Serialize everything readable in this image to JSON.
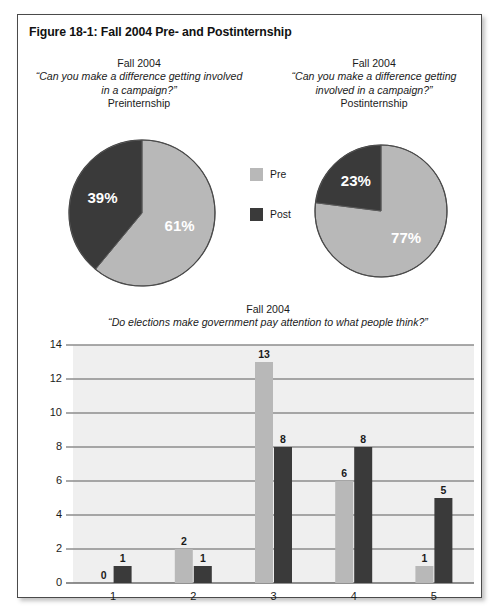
{
  "figure": {
    "title": "Figure 18-1:  Fall 2004 Pre- and Postinternship"
  },
  "colors": {
    "pre": "#b8b8b8",
    "post": "#3a3a3a",
    "plot_background": "#efefef",
    "gridline": "#8d8d8d",
    "axis": "#6b6b6b",
    "border": "#4a4a4a",
    "label_text": "#1b1b1b",
    "slice_label_text": "#ffffff"
  },
  "legend": {
    "items": [
      {
        "label": "Pre",
        "color": "#b8b8b8"
      },
      {
        "label": "Post",
        "color": "#3a3a3a"
      }
    ]
  },
  "pies": {
    "left": {
      "season": "Fall 2004",
      "question": "“Can you make a difference getting involved in a campaign?”",
      "phase": "Preinternship",
      "labels": [
        "61%",
        "39%"
      ]
    },
    "right": {
      "season": "Fall 2004",
      "question": "“Can you make a difference getting involved in a campaign?”",
      "phase": "Postinternship",
      "labels": [
        "77%",
        "23%"
      ]
    }
  },
  "bar_header": {
    "season": "Fall 2004",
    "question": "“Do elections make government pay attention to what people think?”"
  },
  "chart_data": [
    {
      "type": "pie",
      "title": "Fall 2004 — “Can you make a difference getting involved in a campaign?” Preinternship",
      "labels": [
        "Pre",
        "Post"
      ],
      "values": [
        61,
        39
      ],
      "value_labels": [
        "61%",
        "39%"
      ],
      "colors": [
        "#b8b8b8",
        "#3a3a3a"
      ],
      "start_angle_deg": 0,
      "direction": "clockwise",
      "legend_position": "right"
    },
    {
      "type": "pie",
      "title": "Fall 2004 — “Can you make a difference getting involved in a campaign?” Postinternship",
      "labels": [
        "Pre",
        "Post"
      ],
      "values": [
        77,
        23
      ],
      "value_labels": [
        "77%",
        "23%"
      ],
      "colors": [
        "#b8b8b8",
        "#3a3a3a"
      ],
      "start_angle_deg": 0,
      "direction": "clockwise",
      "legend_position": "right"
    },
    {
      "type": "bar",
      "title": "Fall 2004 — “Do elections make government pay attention to what people think?”",
      "categories": [
        "1",
        "2",
        "3",
        "4",
        "5"
      ],
      "series": [
        {
          "name": "Pre",
          "color": "#b8b8b8",
          "values": [
            0,
            2,
            13,
            6,
            1
          ]
        },
        {
          "name": "Post",
          "color": "#3a3a3a",
          "values": [
            1,
            1,
            8,
            8,
            5
          ]
        }
      ],
      "xlabel": "",
      "ylabel": "",
      "ylim": [
        0,
        14
      ],
      "yticks": [
        0,
        2,
        4,
        6,
        8,
        10,
        12,
        14
      ],
      "grid": true,
      "data_labels": true,
      "legend_position": "none"
    }
  ]
}
